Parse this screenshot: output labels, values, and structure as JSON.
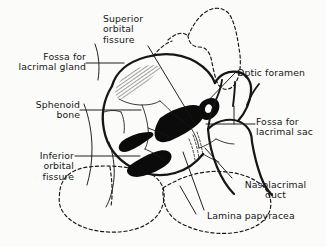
{
  "figure": {
    "width": 326,
    "height": 247,
    "background_color": "#fbfbfa",
    "ink_color": "#161616"
  },
  "labels": [
    {
      "id": "superior-orbital-fissure",
      "text": "Superior\norbital\nfissure",
      "align": "left",
      "x": 103,
      "y": 14
    },
    {
      "id": "fossa-for-lacrimal-gland",
      "text": "Fossa for\nlacrimal gland",
      "align": "right",
      "x": 14,
      "y": 52
    },
    {
      "id": "optic-foramen",
      "text": "Optic foramen",
      "align": "left",
      "x": 237,
      "y": 68
    },
    {
      "id": "sphenoid-bone",
      "text": "Sphenoid\nbone",
      "align": "right",
      "x": 14,
      "y": 100
    },
    {
      "id": "fossa-for-lacrimal-sac",
      "text": "Fossa for\nlacrimal sac",
      "align": "left",
      "x": 256,
      "y": 117
    },
    {
      "id": "inferior-orbital-fissure",
      "text": "Inferior\norbital\nfissure",
      "align": "right",
      "x": 12,
      "y": 151
    },
    {
      "id": "nasolacrimal-duct",
      "text": "Nasolacrimal\nduct",
      "align": "center",
      "x": 236,
      "y": 180
    },
    {
      "id": "lamina-papyracea",
      "text": "Lamina papyracea",
      "align": "left",
      "x": 207,
      "y": 211
    }
  ],
  "structures": [
    {
      "id": "orbital-rim",
      "name": "orbital rim outline",
      "style": "solid-stroke"
    },
    {
      "id": "superior-orbital-fissure-shape",
      "name": "superior orbital fissure",
      "style": "solid-filled-black"
    },
    {
      "id": "inferior-orbital-fissure-shape",
      "name": "inferior orbital fissure",
      "style": "solid-filled-black"
    },
    {
      "id": "optic-foramen-shape",
      "name": "optic foramen",
      "style": "solid-filled-black"
    },
    {
      "id": "lacrimal-gland-fossa-hatch",
      "name": "fossa for lacrimal gland",
      "style": "hatched"
    },
    {
      "id": "nasal-aperture",
      "name": "nasal aperture / nasolacrimal duct",
      "style": "solid-stroke"
    },
    {
      "id": "frontal-sinus-outline",
      "name": "frontal/zygomatic outline",
      "style": "dashed-stroke"
    },
    {
      "id": "maxillary-sinus-outline",
      "name": "maxillary sinus outline",
      "style": "dashed-stroke"
    }
  ]
}
